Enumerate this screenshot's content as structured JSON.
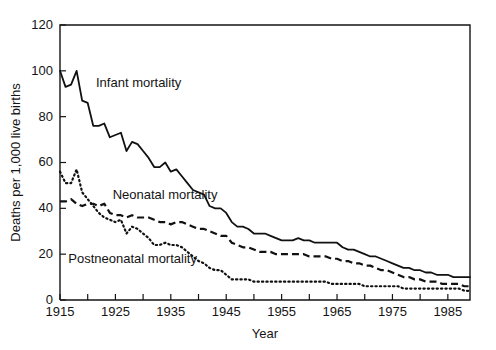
{
  "chart_data": {
    "type": "line",
    "title": "",
    "xlabel": "Year",
    "ylabel": "Deaths per 1,000 live births",
    "xlim": [
      1915,
      1989
    ],
    "ylim": [
      0,
      120
    ],
    "ytick_values": [
      0,
      20,
      40,
      60,
      80,
      100,
      120
    ],
    "ytick_labels": [
      "0",
      "20",
      "40",
      "60",
      "80",
      "100",
      "120"
    ],
    "xtick_values": [
      1915,
      1920,
      1925,
      1930,
      1935,
      1940,
      1945,
      1950,
      1955,
      1960,
      1965,
      1970,
      1975,
      1980,
      1985
    ],
    "xtick_labels": [
      "1915",
      "",
      "1925",
      "",
      "1935",
      "",
      "1945",
      "",
      "1955",
      "",
      "1965",
      "",
      "1975",
      "",
      "1985"
    ],
    "xtick_minor_every": 5,
    "grid": false,
    "legend": "inline-annotations",
    "x": [
      1915,
      1916,
      1917,
      1918,
      1919,
      1920,
      1921,
      1922,
      1923,
      1924,
      1925,
      1926,
      1927,
      1928,
      1929,
      1930,
      1931,
      1932,
      1933,
      1934,
      1935,
      1936,
      1937,
      1938,
      1939,
      1940,
      1941,
      1942,
      1943,
      1944,
      1945,
      1946,
      1947,
      1948,
      1949,
      1950,
      1951,
      1952,
      1953,
      1954,
      1955,
      1956,
      1957,
      1958,
      1959,
      1960,
      1961,
      1962,
      1963,
      1964,
      1965,
      1966,
      1967,
      1968,
      1969,
      1970,
      1971,
      1972,
      1973,
      1974,
      1975,
      1976,
      1977,
      1978,
      1979,
      1980,
      1981,
      1982,
      1983,
      1984,
      1985,
      1986,
      1987,
      1988,
      1989
    ],
    "series": [
      {
        "name": "Infant mortality",
        "style": "solid",
        "label_x": 1921.5,
        "label_y": 93,
        "values": [
          100,
          93,
          94,
          100,
          87,
          86,
          76,
          76,
          77,
          71,
          72,
          73,
          65,
          69,
          68,
          65,
          62,
          58,
          58,
          60,
          56,
          57,
          54,
          51,
          48,
          47,
          46,
          41,
          40,
          40,
          38,
          34,
          32,
          32,
          31,
          29,
          29,
          29,
          28,
          27,
          26,
          26,
          26,
          27,
          26,
          26,
          25,
          25,
          25,
          25,
          25,
          23,
          22,
          22,
          21,
          20,
          19,
          19,
          18,
          17,
          16,
          15,
          14,
          14,
          13,
          13,
          12,
          12,
          11,
          11,
          11,
          10,
          10,
          10,
          10
        ]
      },
      {
        "name": "Neonatal mortality",
        "style": "dashed",
        "label_x": 1924.5,
        "label_y": 44,
        "values": [
          43,
          43,
          44,
          42,
          41,
          42,
          42,
          41,
          42,
          38,
          37,
          37,
          36,
          37,
          36,
          36,
          36,
          35,
          34,
          34,
          33,
          34,
          34,
          33,
          32,
          31,
          31,
          30,
          29,
          28,
          28,
          25,
          24,
          23,
          23,
          22,
          21,
          21,
          21,
          20,
          20,
          20,
          20,
          20,
          20,
          19,
          19,
          19,
          19,
          18,
          18,
          17,
          17,
          16,
          16,
          15,
          15,
          14,
          13,
          13,
          12,
          11,
          10,
          10,
          9,
          9,
          8,
          8,
          8,
          7,
          7,
          7,
          7,
          6,
          6
        ]
      },
      {
        "name": "Postneonatal mortality",
        "style": "dotted",
        "label_x": 1916.5,
        "label_y": 16,
        "values": [
          56,
          51,
          51,
          57,
          47,
          44,
          41,
          38,
          36,
          35,
          34,
          35,
          29,
          32,
          31,
          29,
          27,
          24,
          24,
          25,
          24,
          24,
          23,
          21,
          19,
          17,
          16,
          14,
          13,
          13,
          11,
          9,
          9,
          9,
          9,
          8,
          8,
          8,
          8,
          8,
          8,
          8,
          8,
          8,
          8,
          8,
          8,
          8,
          8,
          7,
          7,
          7,
          7,
          7,
          7,
          6,
          6,
          6,
          6,
          6,
          6,
          6,
          5,
          5,
          5,
          5,
          5,
          5,
          5,
          5,
          5,
          5,
          5,
          4,
          4
        ]
      }
    ]
  }
}
